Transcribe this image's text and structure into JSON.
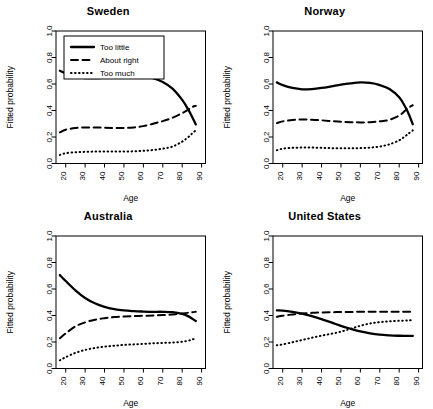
{
  "figure": {
    "xlabel": "Age",
    "ylabel": "Fitted probability",
    "xticks": [
      "20",
      "30",
      "40",
      "50",
      "60",
      "70",
      "80",
      "90"
    ],
    "yticks": [
      "0.0",
      "0.2",
      "0.4",
      "0.6",
      "0.8",
      "1.0"
    ],
    "legend": {
      "items": [
        {
          "label": "Too little",
          "style": "solid"
        },
        {
          "label": "About right",
          "style": "dashed"
        },
        {
          "label": "Too much",
          "style": "dotted"
        }
      ]
    },
    "panel_titles": {
      "sweden": "Sweden",
      "norway": "Norway",
      "australia": "Australia",
      "united_states": "United States"
    }
  },
  "chart_data": {
    "type": "line",
    "title": "",
    "xlabel": "Age",
    "ylabel": "Fitted probability",
    "xlim": [
      15,
      92
    ],
    "ylim": [
      0.0,
      1.0
    ],
    "xticks": [
      20,
      30,
      40,
      50,
      60,
      70,
      80,
      90
    ],
    "yticks": [
      0.0,
      0.2,
      0.4,
      0.6,
      0.8,
      1.0
    ],
    "grid": false,
    "legend_position": "top-left (Sweden panel only)",
    "x": [
      17,
      20,
      25,
      30,
      35,
      40,
      45,
      50,
      55,
      60,
      65,
      70,
      75,
      80,
      83,
      85,
      87
    ],
    "panels": [
      {
        "name": "Sweden",
        "series": [
          {
            "name": "Too little",
            "style": "solid",
            "values": [
              0.7,
              0.68,
              0.655,
              0.645,
              0.645,
              0.648,
              0.652,
              0.658,
              0.662,
              0.66,
              0.645,
              0.615,
              0.565,
              0.48,
              0.41,
              0.355,
              0.295
            ]
          },
          {
            "name": "About right",
            "style": "dashed",
            "values": [
              0.235,
              0.255,
              0.268,
              0.272,
              0.272,
              0.27,
              0.268,
              0.268,
              0.272,
              0.282,
              0.3,
              0.32,
              0.345,
              0.38,
              0.405,
              0.425,
              0.435
            ]
          },
          {
            "name": "Too much",
            "style": "dotted",
            "values": [
              0.065,
              0.078,
              0.085,
              0.088,
              0.09,
              0.09,
              0.09,
              0.09,
              0.092,
              0.096,
              0.102,
              0.112,
              0.128,
              0.165,
              0.198,
              0.225,
              0.25
            ]
          }
        ]
      },
      {
        "name": "Norway",
        "series": [
          {
            "name": "Too little",
            "style": "solid",
            "values": [
              0.612,
              0.592,
              0.57,
              0.56,
              0.562,
              0.57,
              0.582,
              0.595,
              0.605,
              0.612,
              0.608,
              0.592,
              0.562,
              0.5,
              0.43,
              0.37,
              0.296
            ]
          },
          {
            "name": "About right",
            "style": "dashed",
            "values": [
              0.305,
              0.318,
              0.328,
              0.332,
              0.33,
              0.326,
              0.32,
              0.315,
              0.312,
              0.31,
              0.312,
              0.318,
              0.33,
              0.362,
              0.398,
              0.422,
              0.44
            ]
          },
          {
            "name": "Too much",
            "style": "dotted",
            "values": [
              0.1,
              0.112,
              0.118,
              0.12,
              0.12,
              0.118,
              0.116,
              0.115,
              0.115,
              0.116,
              0.12,
              0.128,
              0.145,
              0.175,
              0.205,
              0.228,
              0.25
            ]
          }
        ]
      },
      {
        "name": "Australia",
        "series": [
          {
            "name": "Too little",
            "style": "solid",
            "values": [
              0.705,
              0.66,
              0.59,
              0.532,
              0.492,
              0.465,
              0.448,
              0.438,
              0.433,
              0.43,
              0.428,
              0.428,
              0.425,
              0.412,
              0.395,
              0.378,
              0.358
            ]
          },
          {
            "name": "About right",
            "style": "dashed",
            "values": [
              0.228,
              0.265,
              0.318,
              0.348,
              0.368,
              0.38,
              0.388,
              0.392,
              0.395,
              0.398,
              0.4,
              0.403,
              0.408,
              0.415,
              0.42,
              0.425,
              0.428
            ]
          },
          {
            "name": "Too much",
            "style": "dotted",
            "values": [
              0.062,
              0.085,
              0.118,
              0.14,
              0.155,
              0.165,
              0.172,
              0.178,
              0.182,
              0.186,
              0.19,
              0.193,
              0.196,
              0.202,
              0.21,
              0.218,
              0.228
            ]
          }
        ]
      },
      {
        "name": "United States",
        "series": [
          {
            "name": "Too little",
            "style": "solid",
            "values": [
              0.438,
              0.437,
              0.428,
              0.415,
              0.395,
              0.372,
              0.348,
              0.322,
              0.3,
              0.28,
              0.265,
              0.255,
              0.25,
              0.247,
              0.246,
              0.246,
              0.246
            ]
          },
          {
            "name": "About right",
            "style": "dashed",
            "values": [
              0.39,
              0.398,
              0.408,
              0.415,
              0.42,
              0.423,
              0.425,
              0.426,
              0.427,
              0.428,
              0.428,
              0.428,
              0.428,
              0.428,
              0.428,
              0.428,
              0.428
            ]
          },
          {
            "name": "Too much",
            "style": "dotted",
            "values": [
              0.175,
              0.182,
              0.198,
              0.215,
              0.232,
              0.248,
              0.262,
              0.278,
              0.3,
              0.322,
              0.34,
              0.35,
              0.356,
              0.36,
              0.362,
              0.363,
              0.364
            ]
          }
        ]
      }
    ]
  }
}
